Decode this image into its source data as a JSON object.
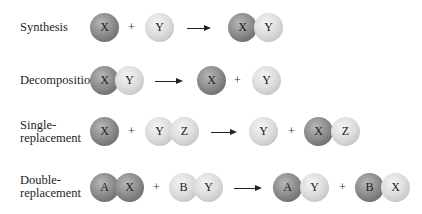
{
  "rows": [
    {
      "label": "Synthesis",
      "reactant1": [
        "X"
      ],
      "plus1": "+",
      "reactant2": [
        "Y"
      ],
      "product1": [
        "X",
        "Y"
      ]
    },
    {
      "label": "Decomposition",
      "reactant1": [
        "X",
        "Y"
      ],
      "product1": [
        "X"
      ],
      "plus2": "+",
      "product2": [
        "Y"
      ]
    },
    {
      "label_line1": "Single-",
      "label_line2": "replacement",
      "reactant1": [
        "X"
      ],
      "plus1": "+",
      "reactant2": [
        "Y",
        "Z"
      ],
      "product1": [
        "Y"
      ],
      "plus2": "+",
      "product2": [
        "X",
        "Z"
      ]
    },
    {
      "label_line1": "Double-",
      "label_line2": "replacement",
      "reactant1": [
        "A",
        "X"
      ],
      "plus1": "+",
      "reactant2": [
        "B",
        "Y"
      ],
      "product1": [
        "A",
        "Y"
      ],
      "plus2": "+",
      "product2": [
        "B",
        "X"
      ]
    }
  ],
  "colors": {
    "dark_atom": "#8e8e8e",
    "light_atom": "#dedede",
    "arrow": "#222222"
  }
}
